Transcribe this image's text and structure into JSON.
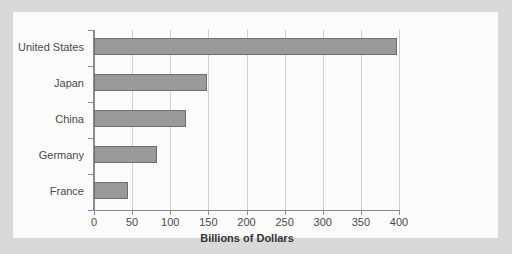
{
  "chart_data": {
    "type": "bar",
    "orientation": "horizontal",
    "title": "",
    "xlabel": "Billions of Dollars",
    "ylabel": "",
    "categories": [
      "United States",
      "Japan",
      "China",
      "Germany",
      "France"
    ],
    "values": [
      398,
      148,
      120,
      82,
      45
    ],
    "series": [
      {
        "name": "Billions of Dollars",
        "values": [
          398,
          148,
          120,
          82,
          45
        ]
      }
    ],
    "xlim": [
      0,
      400
    ],
    "xticks": [
      0,
      50,
      100,
      150,
      200,
      250,
      300,
      350,
      400
    ],
    "xtick_labels": [
      "0",
      "50",
      "100",
      "150",
      "200",
      "250",
      "300",
      "350",
      "400"
    ],
    "grid": "vertical",
    "legend": "none",
    "bar_color": "#9a9a9a",
    "bar_edge_color": "#6e6e6e",
    "grid_color": "#cfcfcf",
    "axis_color": "#8c8c8c",
    "panel_background": "#fbfbfb",
    "figure_background": "#d9d9d9"
  }
}
